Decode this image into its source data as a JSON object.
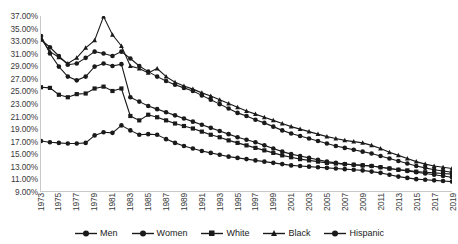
{
  "chart_data": {
    "type": "line",
    "title": "",
    "xlabel": "",
    "ylabel": "",
    "grid": false,
    "legend_position": "bottom",
    "ylim": [
      9,
      37
    ],
    "ytick_values": [
      37,
      35,
      33,
      31,
      29,
      27,
      25,
      23,
      21,
      19,
      17,
      15,
      13,
      11,
      9
    ],
    "ytick_labels": [
      "37.00%",
      "35.00%",
      "33.00%",
      "31.00%",
      "29.00%",
      "27.00%",
      "25.00%",
      "23.00%",
      "21.00%",
      "19.00%",
      "17.00%",
      "15.00%",
      "13.00%",
      "11.00%",
      "9.00%"
    ],
    "xlim": [
      1973,
      2019
    ],
    "x": [
      1973,
      1974,
      1975,
      1976,
      1977,
      1978,
      1979,
      1980,
      1981,
      1982,
      1983,
      1984,
      1985,
      1986,
      1987,
      1988,
      1989,
      1990,
      1991,
      1992,
      1993,
      1994,
      1995,
      1996,
      1997,
      1998,
      1999,
      2000,
      2001,
      2002,
      2003,
      2004,
      2005,
      2006,
      2007,
      2008,
      2009,
      2010,
      2011,
      2012,
      2013,
      2014,
      2015,
      2016,
      2017,
      2018,
      2019
    ],
    "xtick_values": [
      1973,
      1975,
      1977,
      1979,
      1981,
      1983,
      1985,
      1987,
      1989,
      1991,
      1993,
      1995,
      1997,
      1999,
      2001,
      2003,
      2005,
      2007,
      2009,
      2011,
      2013,
      2015,
      2017,
      2019
    ],
    "xtick_labels": [
      "1973",
      "1975",
      "1977",
      "1979",
      "1981",
      "1983",
      "1985",
      "1987",
      "1989",
      "1991",
      "1993",
      "1995",
      "1997",
      "1999",
      "2001",
      "2003",
      "2005",
      "2007",
      "2009",
      "2011",
      "2013",
      "2015",
      "2017",
      "2019"
    ],
    "series": [
      {
        "name": "Men",
        "marker": "circle",
        "color": "#1a1a1a",
        "values": [
          33.2,
          32.0,
          30.6,
          29.2,
          29.4,
          30.3,
          31.3,
          31.0,
          30.6,
          31.3,
          30.2,
          29.0,
          28.1,
          27.3,
          26.6,
          26.0,
          25.5,
          25.0,
          24.3,
          23.6,
          22.9,
          22.2,
          21.5,
          21.0,
          20.4,
          19.9,
          19.3,
          18.7,
          18.2,
          17.8,
          17.4,
          17.0,
          16.6,
          16.2,
          15.9,
          15.6,
          15.3,
          15.0,
          14.6,
          14.2,
          13.8,
          13.4,
          13.0,
          12.7,
          12.4,
          12.2,
          12.0
        ]
      },
      {
        "name": "Women",
        "marker": "circle",
        "color": "#1a1a1a",
        "values": [
          33.8,
          31.0,
          28.9,
          27.3,
          26.7,
          27.3,
          28.9,
          29.4,
          29.0,
          29.3,
          24.0,
          23.3,
          22.6,
          22.1,
          21.6,
          21.1,
          20.6,
          20.1,
          19.6,
          19.1,
          18.6,
          18.1,
          17.6,
          17.2,
          16.8,
          16.3,
          15.8,
          15.3,
          14.9,
          14.6,
          14.3,
          14.0,
          13.7,
          13.5,
          13.3,
          13.2,
          13.1,
          13.0,
          12.8,
          12.6,
          12.4,
          12.2,
          12.0,
          11.8,
          11.6,
          11.4,
          11.2
        ]
      },
      {
        "name": "White",
        "marker": "square",
        "color": "#1a1a1a",
        "values": [
          25.6,
          25.5,
          24.4,
          24.0,
          24.5,
          24.6,
          25.4,
          25.7,
          25.0,
          25.4,
          21.0,
          20.3,
          21.2,
          20.8,
          20.3,
          19.8,
          19.4,
          19.0,
          18.5,
          18.0,
          17.6,
          17.1,
          16.7,
          16.3,
          15.9,
          15.5,
          15.1,
          14.7,
          14.4,
          14.1,
          13.9,
          13.7,
          13.5,
          13.4,
          13.3,
          13.2,
          13.1,
          13.0,
          12.8,
          12.6,
          12.4,
          12.3,
          12.1,
          12.0,
          11.9,
          11.8,
          11.7
        ]
      },
      {
        "name": "Black",
        "marker": "triangle",
        "color": "#1a1a1a",
        "values": [
          33.4,
          31.3,
          30.4,
          29.4,
          30.3,
          31.9,
          33.1,
          36.9,
          34.0,
          32.2,
          29.0,
          28.6,
          27.9,
          28.6,
          27.3,
          26.4,
          25.8,
          25.3,
          24.7,
          24.2,
          23.6,
          23.0,
          22.4,
          21.8,
          21.3,
          20.8,
          20.3,
          19.8,
          19.3,
          18.9,
          18.5,
          18.1,
          17.7,
          17.4,
          17.1,
          16.9,
          16.7,
          16.3,
          15.8,
          15.2,
          14.7,
          14.2,
          13.7,
          13.3,
          13.0,
          12.8,
          12.6
        ]
      },
      {
        "name": "Hispanic",
        "marker": "circle",
        "color": "#1a1a1a",
        "values": [
          17.0,
          16.8,
          16.7,
          16.6,
          16.6,
          16.7,
          17.9,
          18.4,
          18.3,
          19.5,
          18.7,
          18.0,
          18.1,
          18.0,
          17.3,
          16.7,
          16.2,
          15.8,
          15.4,
          15.1,
          14.8,
          14.5,
          14.3,
          14.1,
          13.9,
          13.7,
          13.5,
          13.3,
          13.1,
          13.0,
          12.9,
          12.8,
          12.7,
          12.6,
          12.5,
          12.4,
          12.3,
          12.1,
          11.9,
          11.6,
          11.3,
          11.1,
          10.9,
          10.8,
          10.7,
          10.6,
          10.5
        ]
      }
    ]
  }
}
